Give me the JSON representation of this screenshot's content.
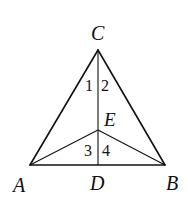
{
  "figure": {
    "type": "geometry-triangle",
    "points": {
      "A": {
        "label": "A",
        "x": 30,
        "y": 165
      },
      "B": {
        "label": "B",
        "x": 165,
        "y": 165
      },
      "C": {
        "label": "C",
        "x": 98,
        "y": 50
      },
      "D": {
        "label": "D",
        "x": 98,
        "y": 165
      },
      "E": {
        "label": "E",
        "x": 98,
        "y": 130
      }
    },
    "segments": [
      "AC",
      "BC",
      "AB",
      "CD",
      "AE",
      "BE"
    ],
    "angles": [
      {
        "label": "1",
        "at": "C",
        "side": "left"
      },
      {
        "label": "2",
        "at": "C",
        "side": "right"
      },
      {
        "label": "3",
        "at": "E",
        "side": "left"
      },
      {
        "label": "4",
        "at": "E",
        "side": "right"
      }
    ],
    "stroke_color": "#111111"
  }
}
